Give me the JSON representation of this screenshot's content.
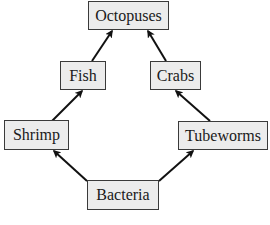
{
  "diagram": {
    "type": "food-web",
    "nodes": [
      {
        "id": "octopuses",
        "label": "Octopuses"
      },
      {
        "id": "fish",
        "label": "Fish"
      },
      {
        "id": "crabs",
        "label": "Crabs"
      },
      {
        "id": "shrimp",
        "label": "Shrimp"
      },
      {
        "id": "tubeworms",
        "label": "Tubeworms"
      },
      {
        "id": "bacteria",
        "label": "Bacteria"
      }
    ],
    "edges": [
      {
        "from": "bacteria",
        "to": "shrimp"
      },
      {
        "from": "bacteria",
        "to": "tubeworms"
      },
      {
        "from": "shrimp",
        "to": "fish"
      },
      {
        "from": "tubeworms",
        "to": "crabs"
      },
      {
        "from": "fish",
        "to": "octopuses"
      },
      {
        "from": "crabs",
        "to": "octopuses"
      }
    ],
    "colors": {
      "node_fill": "#ececec",
      "node_border": "#3a3a3a",
      "arrow": "#111111",
      "text": "#1a1a1a"
    }
  }
}
